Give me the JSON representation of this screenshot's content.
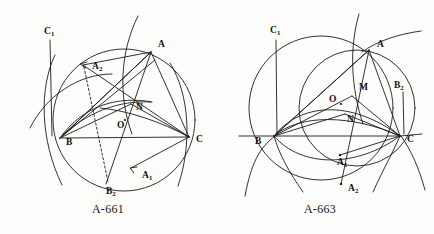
{
  "page": {
    "background_color": "#fdfdfc",
    "ink_color": "#1b1b1b",
    "figure_count": 2
  },
  "figures": [
    {
      "id": "A-661",
      "caption": "A-661",
      "caption_pos": {
        "x": 108,
        "y": 213
      },
      "labels": [
        {
          "key": "C1",
          "base": "C",
          "sub": "1",
          "x": 44,
          "y": 34
        },
        {
          "key": "A2",
          "base": "A",
          "sub": "2",
          "x": 92,
          "y": 69
        },
        {
          "key": "A",
          "base": "A",
          "sub": "",
          "x": 158,
          "y": 47
        },
        {
          "key": "N",
          "base": "N",
          "sub": "",
          "x": 136,
          "y": 110
        },
        {
          "key": "O",
          "base": "O",
          "sub": "",
          "x": 117,
          "y": 128
        },
        {
          "key": "B",
          "base": "B",
          "sub": "",
          "x": 66,
          "y": 145
        },
        {
          "key": "C",
          "base": "C",
          "sub": "",
          "x": 196,
          "y": 142
        },
        {
          "key": "A1",
          "base": "A",
          "sub": "1",
          "x": 142,
          "y": 178
        },
        {
          "key": "B2",
          "base": "B",
          "sub": "2",
          "x": 106,
          "y": 194
        }
      ],
      "points": {
        "A": {
          "x": 151,
          "y": 52
        },
        "B": {
          "x": 60,
          "y": 138
        },
        "C": {
          "x": 189,
          "y": 137
        },
        "N": {
          "x": 131,
          "y": 104
        },
        "O": {
          "x": 123,
          "y": 122
        },
        "A1": {
          "x": 131,
          "y": 168
        },
        "A2": {
          "x": 83,
          "y": 65
        },
        "B2": {
          "x": 106,
          "y": 184
        },
        "C1": {
          "x": 48,
          "y": 42
        }
      }
    },
    {
      "id": "A-663",
      "caption": "A-663",
      "caption_pos": {
        "x": 103,
        "y": 213
      },
      "labels": [
        {
          "key": "C1",
          "base": "C",
          "sub": "1",
          "x": 53,
          "y": 33
        },
        {
          "key": "A",
          "base": "A",
          "sub": "",
          "x": 160,
          "y": 47
        },
        {
          "key": "B2",
          "base": "B",
          "sub": "2",
          "x": 177,
          "y": 88
        },
        {
          "key": "M",
          "base": "M",
          "sub": "",
          "x": 142,
          "y": 90
        },
        {
          "key": "O",
          "base": "O",
          "sub": "",
          "x": 112,
          "y": 102
        },
        {
          "key": "N",
          "base": "N",
          "sub": "",
          "x": 130,
          "y": 122
        },
        {
          "key": "B",
          "base": "B",
          "sub": "",
          "x": 38,
          "y": 144
        },
        {
          "key": "C",
          "base": "C",
          "sub": "",
          "x": 190,
          "y": 142
        },
        {
          "key": "A1",
          "base": "A",
          "sub": "1",
          "x": 120,
          "y": 165
        },
        {
          "key": "A2",
          "base": "A",
          "sub": "2",
          "x": 131,
          "y": 191
        }
      ],
      "points": {
        "A": {
          "x": 152,
          "y": 50
        },
        "B": {
          "x": 57,
          "y": 136
        },
        "C": {
          "x": 183,
          "y": 136
        },
        "M": {
          "x": 135,
          "y": 96
        },
        "O": {
          "x": 122,
          "y": 103
        },
        "N": {
          "x": 128,
          "y": 114
        },
        "A1": {
          "x": 123,
          "y": 155
        },
        "A2": {
          "x": 124,
          "y": 184
        },
        "C1": {
          "x": 58,
          "y": 42
        }
      }
    }
  ],
  "diagram_meta": {
    "kind": "compass-and-straightedge geometric construction",
    "subject": "triangle ABC with circumscribed and intersecting arcs",
    "line_style_notes": [
      "solid arcs",
      "solid chords",
      "one dashed segment in A-661"
    ]
  }
}
